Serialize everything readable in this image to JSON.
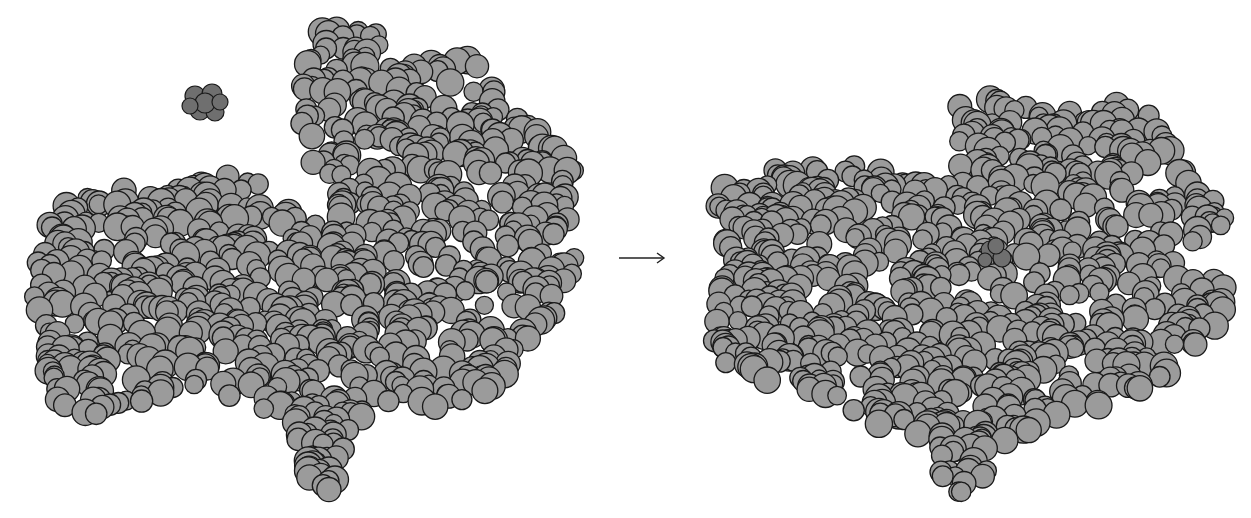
{
  "figure": {
    "type": "enzyme-substrate binding (space-filling model)",
    "colors": {
      "background": "#ffffff",
      "enzyme": "#9b9b9b",
      "substrate": "#6f6f6f",
      "outline": "#1a1a1a"
    },
    "arrow": {
      "symbol": "→",
      "x1": 619,
      "x2": 664,
      "y": 258
    },
    "panels": [
      {
        "name": "before-binding",
        "seed": 11,
        "atom_radius": [
          9,
          14
        ],
        "count": 950,
        "outline": [
          [
            28,
            270
          ],
          [
            40,
            220
          ],
          [
            70,
            200
          ],
          [
            120,
            188
          ],
          [
            170,
            192
          ],
          [
            215,
            180
          ],
          [
            240,
            170
          ],
          [
            258,
            178
          ],
          [
            262,
            205
          ],
          [
            280,
            210
          ],
          [
            300,
            215
          ],
          [
            325,
            225
          ],
          [
            340,
            215
          ],
          [
            330,
            180
          ],
          [
            300,
            160
          ],
          [
            290,
            120
          ],
          [
            296,
            80
          ],
          [
            290,
            50
          ],
          [
            310,
            30
          ],
          [
            340,
            25
          ],
          [
            370,
            30
          ],
          [
            400,
            45
          ],
          [
            430,
            55
          ],
          [
            460,
            55
          ],
          [
            480,
            60
          ],
          [
            495,
            90
          ],
          [
            520,
            120
          ],
          [
            540,
            130
          ],
          [
            560,
            150
          ],
          [
            575,
            165
          ],
          [
            568,
            200
          ],
          [
            575,
            230
          ],
          [
            575,
            270
          ],
          [
            560,
            290
          ],
          [
            550,
            330
          ],
          [
            530,
            350
          ],
          [
            510,
            360
          ],
          [
            505,
            380
          ],
          [
            480,
            400
          ],
          [
            450,
            410
          ],
          [
            400,
            400
          ],
          [
            370,
            410
          ],
          [
            350,
            430
          ],
          [
            340,
            470
          ],
          [
            330,
            490
          ],
          [
            300,
            490
          ],
          [
            302,
            468
          ],
          [
            290,
            420
          ],
          [
            262,
            420
          ],
          [
            240,
            410
          ],
          [
            215,
            390
          ],
          [
            195,
            390
          ],
          [
            170,
            400
          ],
          [
            140,
            405
          ],
          [
            120,
            410
          ],
          [
            90,
            415
          ],
          [
            60,
            405
          ],
          [
            48,
            380
          ],
          [
            40,
            350
          ],
          [
            45,
            330
          ],
          [
            35,
            305
          ]
        ],
        "substrate": {
          "cx": 204,
          "cy": 104,
          "atoms": [
            [
              195,
              96,
              10
            ],
            [
              212,
              94,
              10
            ],
            [
              200,
              110,
              10
            ],
            [
              215,
              112,
              9
            ],
            [
              205,
              103,
              10
            ],
            [
              190,
              106,
              8
            ],
            [
              220,
              102,
              8
            ]
          ]
        }
      },
      {
        "name": "after-binding",
        "seed": 29,
        "atom_radius": [
          9,
          14
        ],
        "count": 900,
        "outline": [
          [
            708,
            220
          ],
          [
            720,
            190
          ],
          [
            760,
            170
          ],
          [
            800,
            160
          ],
          [
            850,
            165
          ],
          [
            900,
            175
          ],
          [
            935,
            185
          ],
          [
            948,
            180
          ],
          [
            945,
            130
          ],
          [
            960,
            105
          ],
          [
            990,
            95
          ],
          [
            1020,
            95
          ],
          [
            1060,
            110
          ],
          [
            1100,
            110
          ],
          [
            1120,
            100
          ],
          [
            1150,
            115
          ],
          [
            1165,
            140
          ],
          [
            1175,
            160
          ],
          [
            1195,
            180
          ],
          [
            1215,
            195
          ],
          [
            1230,
            210
          ],
          [
            1225,
            230
          ],
          [
            1205,
            250
          ],
          [
            1220,
            260
          ],
          [
            1232,
            290
          ],
          [
            1225,
            320
          ],
          [
            1200,
            340
          ],
          [
            1185,
            360
          ],
          [
            1160,
            380
          ],
          [
            1130,
            400
          ],
          [
            1100,
            410
          ],
          [
            1070,
            415
          ],
          [
            1045,
            420
          ],
          [
            1020,
            440
          ],
          [
            1000,
            450
          ],
          [
            990,
            470
          ],
          [
            975,
            490
          ],
          [
            950,
            495
          ],
          [
            932,
            480
          ],
          [
            930,
            450
          ],
          [
            910,
            440
          ],
          [
            880,
            430
          ],
          [
            850,
            410
          ],
          [
            820,
            395
          ],
          [
            790,
            385
          ],
          [
            760,
            380
          ],
          [
            730,
            370
          ],
          [
            712,
            350
          ],
          [
            712,
            310
          ],
          [
            720,
            280
          ],
          [
            712,
            250
          ]
        ],
        "substrate": {
          "cx": 996,
          "cy": 254,
          "atoms": [
            [
              990,
              250,
              9
            ],
            [
              1002,
              258,
              9
            ],
            [
              996,
              246,
              8
            ],
            [
              985,
              260,
              7
            ]
          ]
        }
      }
    ]
  }
}
